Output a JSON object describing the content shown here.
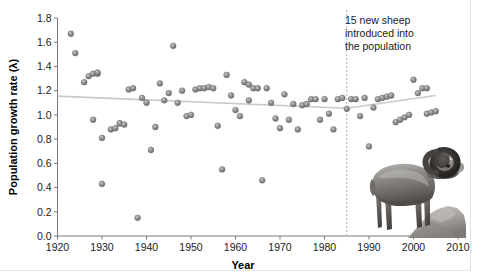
{
  "figure": {
    "annotation": {
      "lines": [
        "15 new sheep",
        "introduced into",
        "the population"
      ],
      "event_year": 1985
    },
    "photo": {
      "subject": "bighorn-sheep-ram-on-rock",
      "style": "grayscale-photograph"
    },
    "colors": {
      "point_fill": "#8c8c8c",
      "point_stroke": "#5d5d5d",
      "trend_line": "#c9c9c9",
      "axis": "#7a7a7a",
      "event_line": "#b0b0b0",
      "text": "#1a1a1a",
      "background": "#ffffff"
    }
  },
  "chart_data": {
    "type": "scatter",
    "title": "",
    "xlabel": "Year",
    "ylabel": "Population growth rate (λ)",
    "xlim": [
      1920,
      2010
    ],
    "ylim": [
      0.0,
      1.8
    ],
    "xticks": [
      1920,
      1930,
      1940,
      1950,
      1960,
      1970,
      1980,
      1990,
      2000,
      2010
    ],
    "yticks": [
      0.0,
      0.2,
      0.4,
      0.6,
      0.8,
      1.0,
      1.2,
      1.4,
      1.6,
      1.8
    ],
    "xtick_labels": [
      "1920",
      "1930",
      "1940",
      "1950",
      "1960",
      "1970",
      "1980",
      "1990",
      "2000",
      "2010"
    ],
    "ytick_labels": [
      "0.0",
      "0.2",
      "0.4",
      "0.6",
      "0.8",
      "1.0",
      "1.2",
      "1.4",
      "1.6",
      "1.8"
    ],
    "grid": false,
    "legend": null,
    "series": [
      {
        "name": "Population growth rate",
        "marker": "circle",
        "points": [
          [
            1923,
            1.67
          ],
          [
            1924,
            1.51
          ],
          [
            1926,
            1.27
          ],
          [
            1927,
            1.32
          ],
          [
            1928,
            1.34
          ],
          [
            1928,
            0.96
          ],
          [
            1929,
            1.34
          ],
          [
            1929,
            1.35
          ],
          [
            1930,
            0.81
          ],
          [
            1930,
            0.43
          ],
          [
            1932,
            0.88
          ],
          [
            1933,
            0.89
          ],
          [
            1934,
            0.93
          ],
          [
            1934,
            0.93
          ],
          [
            1935,
            0.92
          ],
          [
            1936,
            1.21
          ],
          [
            1937,
            1.22
          ],
          [
            1938,
            0.15
          ],
          [
            1939,
            1.14
          ],
          [
            1940,
            1.1
          ],
          [
            1941,
            0.71
          ],
          [
            1942,
            0.9
          ],
          [
            1943,
            1.26
          ],
          [
            1944,
            1.12
          ],
          [
            1945,
            1.18
          ],
          [
            1946,
            1.57
          ],
          [
            1947,
            1.1
          ],
          [
            1948,
            1.2
          ],
          [
            1949,
            0.99
          ],
          [
            1950,
            1.0
          ],
          [
            1951,
            1.21
          ],
          [
            1952,
            1.22
          ],
          [
            1953,
            1.22
          ],
          [
            1954,
            1.23
          ],
          [
            1955,
            1.22
          ],
          [
            1956,
            0.91
          ],
          [
            1957,
            0.55
          ],
          [
            1958,
            1.33
          ],
          [
            1959,
            1.16
          ],
          [
            1960,
            1.04
          ],
          [
            1961,
            0.99
          ],
          [
            1962,
            1.27
          ],
          [
            1963,
            1.12
          ],
          [
            1963,
            1.25
          ],
          [
            1964,
            1.22
          ],
          [
            1965,
            1.22
          ],
          [
            1966,
            0.46
          ],
          [
            1967,
            1.22
          ],
          [
            1968,
            1.1
          ],
          [
            1969,
            0.97
          ],
          [
            1970,
            0.89
          ],
          [
            1971,
            1.17
          ],
          [
            1972,
            0.96
          ],
          [
            1973,
            1.09
          ],
          [
            1974,
            0.88
          ],
          [
            1975,
            1.08
          ],
          [
            1976,
            1.09
          ],
          [
            1977,
            1.13
          ],
          [
            1978,
            1.13
          ],
          [
            1979,
            0.96
          ],
          [
            1980,
            1.13
          ],
          [
            1981,
            1.01
          ],
          [
            1982,
            0.88
          ],
          [
            1983,
            1.13
          ],
          [
            1984,
            1.14
          ],
          [
            1985,
            1.05
          ],
          [
            1986,
            1.13
          ],
          [
            1987,
            1.13
          ],
          [
            1988,
            0.99
          ],
          [
            1989,
            1.14
          ],
          [
            1990,
            0.74
          ],
          [
            1991,
            1.06
          ],
          [
            1992,
            1.13
          ],
          [
            1993,
            1.14
          ],
          [
            1994,
            1.15
          ],
          [
            1995,
            1.16
          ],
          [
            1996,
            0.94
          ],
          [
            1997,
            0.96
          ],
          [
            1998,
            0.98
          ],
          [
            1999,
            1.0
          ],
          [
            2000,
            1.29
          ],
          [
            2001,
            1.18
          ],
          [
            2002,
            1.22
          ],
          [
            2003,
            1.22
          ],
          [
            2003,
            1.01
          ],
          [
            2004,
            1.02
          ],
          [
            2005,
            1.03
          ]
        ]
      }
    ],
    "trend": {
      "name": "fitted trend",
      "points": [
        [
          1920,
          1.155
        ],
        [
          1985,
          1.055
        ],
        [
          2005,
          1.16
        ]
      ]
    },
    "annotations": [
      {
        "type": "vline",
        "x": 1985,
        "style": "dashed",
        "label": "15 new sheep introduced into the population"
      }
    ]
  }
}
